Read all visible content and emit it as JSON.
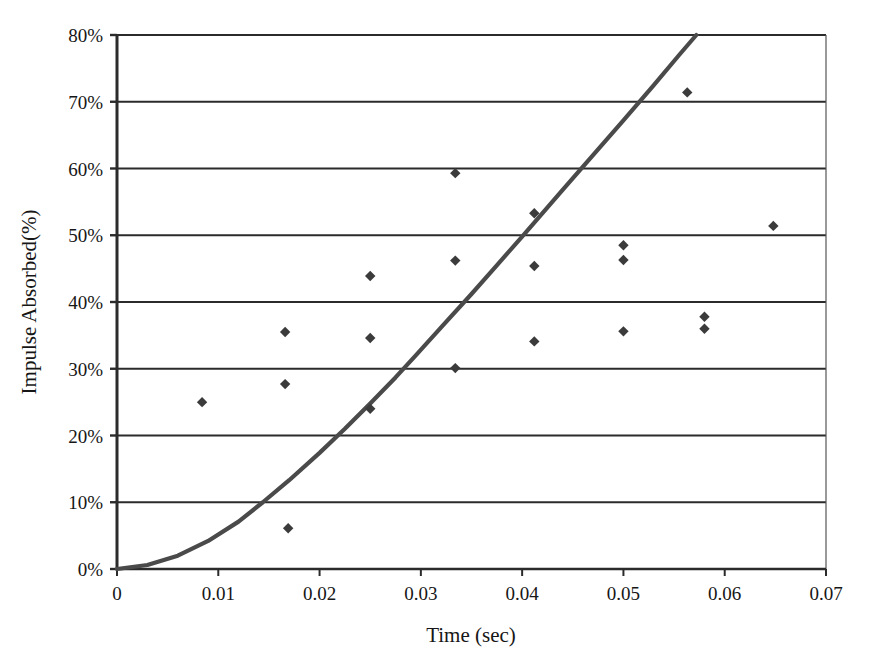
{
  "chart_data": {
    "type": "scatter",
    "title": "",
    "xlabel": "Time (sec)",
    "ylabel": "Impulse Absorbed(%)",
    "xlim": [
      0,
      0.07
    ],
    "ylim": [
      0,
      80
    ],
    "xticks": [
      "0",
      "0.01",
      "0.02",
      "0.03",
      "0.04",
      "0.05",
      "0.06",
      "0.07"
    ],
    "xtick_values": [
      0,
      0.01,
      0.02,
      0.03,
      0.04,
      0.05,
      0.06,
      0.07
    ],
    "yticks": [
      "0%",
      "10%",
      "20%",
      "30%",
      "40%",
      "50%",
      "60%",
      "70%",
      "80%"
    ],
    "ytick_values": [
      0,
      10,
      20,
      30,
      40,
      50,
      60,
      70,
      80
    ],
    "grid": "horizontal",
    "legend": "none",
    "marker": "diamond",
    "marker_color": "#3b3b3b",
    "line_color": "#4a4a4a",
    "axis_color": "#2b2b2b",
    "series": [
      {
        "name": "measured",
        "type": "scatter",
        "points": [
          {
            "x": 0.0084,
            "y": 25.0
          },
          {
            "x": 0.0166,
            "y": 35.5
          },
          {
            "x": 0.0166,
            "y": 27.7
          },
          {
            "x": 0.0169,
            "y": 6.1
          },
          {
            "x": 0.025,
            "y": 43.9
          },
          {
            "x": 0.025,
            "y": 34.6
          },
          {
            "x": 0.025,
            "y": 24.0
          },
          {
            "x": 0.0334,
            "y": 59.3
          },
          {
            "x": 0.0334,
            "y": 46.2
          },
          {
            "x": 0.0334,
            "y": 30.1
          },
          {
            "x": 0.0412,
            "y": 53.3
          },
          {
            "x": 0.0412,
            "y": 45.4
          },
          {
            "x": 0.0412,
            "y": 34.1
          },
          {
            "x": 0.05,
            "y": 48.5
          },
          {
            "x": 0.05,
            "y": 46.3
          },
          {
            "x": 0.05,
            "y": 35.6
          },
          {
            "x": 0.0563,
            "y": 71.4
          },
          {
            "x": 0.058,
            "y": 37.8
          },
          {
            "x": 0.058,
            "y": 36.0
          },
          {
            "x": 0.0648,
            "y": 51.4
          }
        ]
      },
      {
        "name": "model-curve",
        "type": "line",
        "points": [
          {
            "x": 0.0,
            "y": 0.0
          },
          {
            "x": 0.003,
            "y": 0.6
          },
          {
            "x": 0.006,
            "y": 2.0
          },
          {
            "x": 0.009,
            "y": 4.2
          },
          {
            "x": 0.012,
            "y": 7.1
          },
          {
            "x": 0.0144,
            "y": 10.0
          },
          {
            "x": 0.017,
            "y": 13.3
          },
          {
            "x": 0.02,
            "y": 17.4
          },
          {
            "x": 0.0225,
            "y": 21.0
          },
          {
            "x": 0.025,
            "y": 24.8
          },
          {
            "x": 0.0275,
            "y": 28.7
          },
          {
            "x": 0.0295,
            "y": 32.0
          },
          {
            "x": 0.032,
            "y": 36.2
          },
          {
            "x": 0.035,
            "y": 41.2
          },
          {
            "x": 0.0375,
            "y": 45.5
          },
          {
            "x": 0.04,
            "y": 49.8
          },
          {
            "x": 0.0412,
            "y": 51.9
          },
          {
            "x": 0.044,
            "y": 56.8
          },
          {
            "x": 0.047,
            "y": 62.0
          },
          {
            "x": 0.05,
            "y": 67.2
          },
          {
            "x": 0.053,
            "y": 72.5
          },
          {
            "x": 0.0555,
            "y": 77.0
          },
          {
            "x": 0.0572,
            "y": 80.0
          }
        ]
      }
    ]
  }
}
